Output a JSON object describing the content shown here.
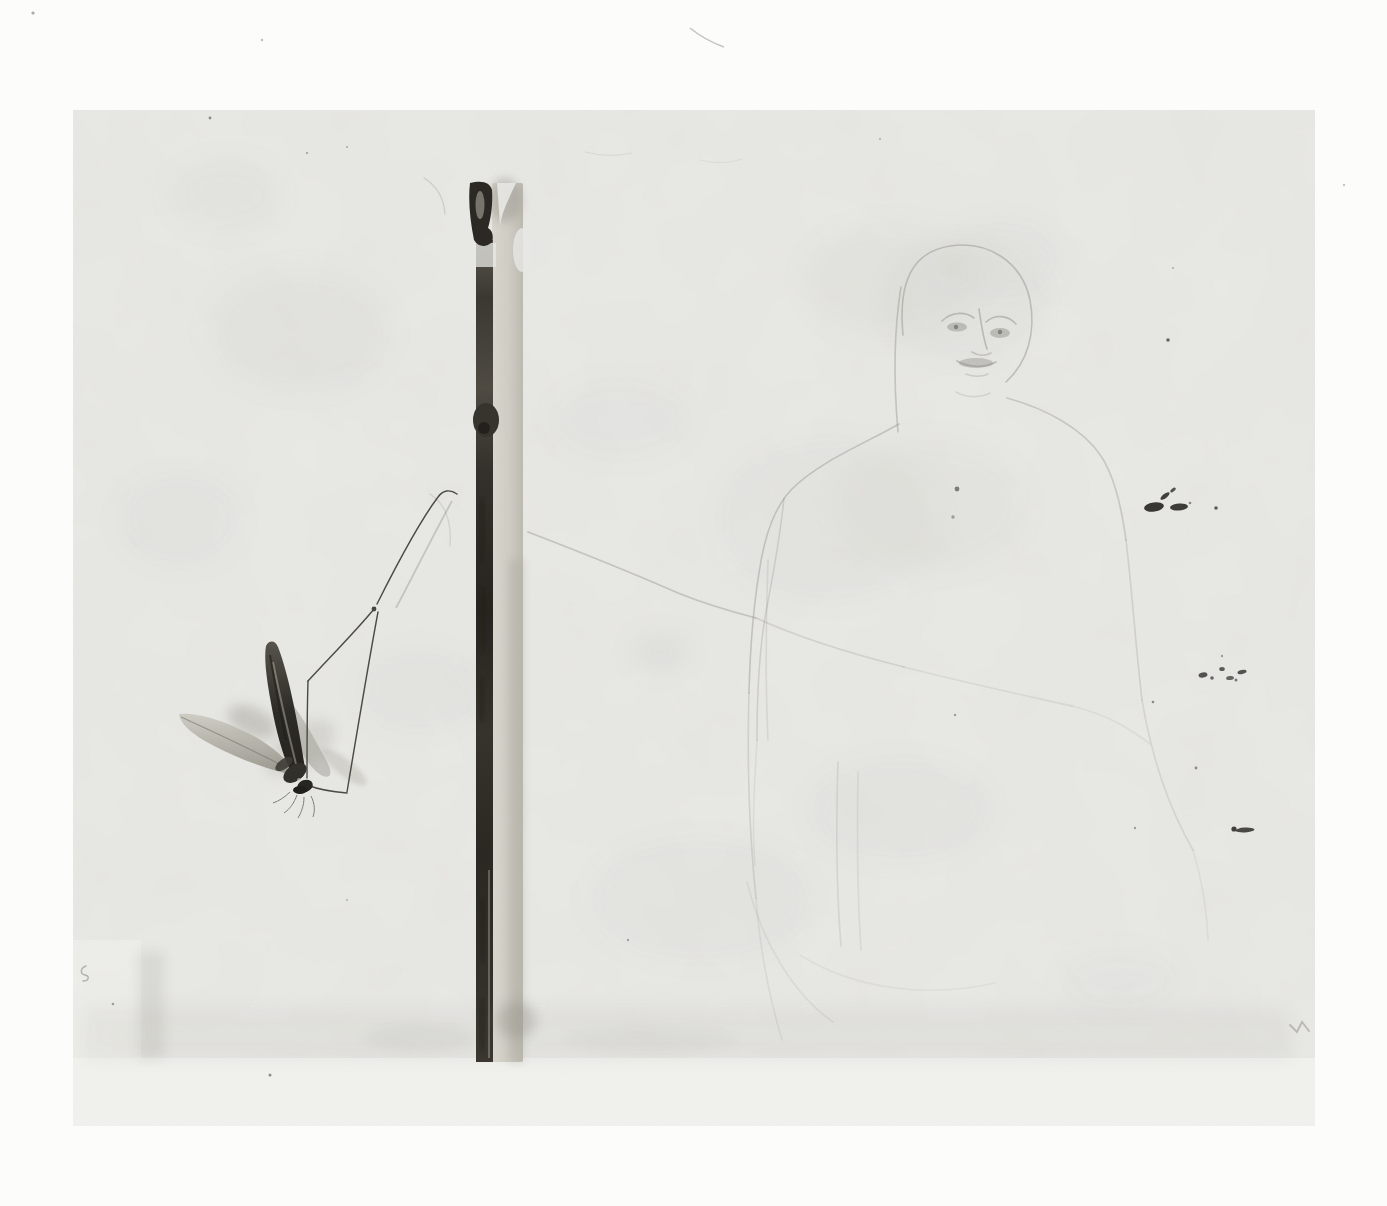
{
  "artwork": {
    "medium": "black-and-white photograph of a mixed-media drawing",
    "description": "A pale gray sheet bears a faint graphite sketch of a bald figure's head and torso on the right, a vertical dried plant stem with a dark fibrous edge left of center, and a pressed crane-fly-like insect with dark folded wings and long angular jointed legs on the lower left. Clusters of small dark ink specks, a short dash, an S-shaped squiggle and soft creases mark the paper.",
    "elements": {
      "insect": "pressed crane fly: one dark upright wing, one pale horizontal wing, translucent wing shadow, dark body with antennae hairs, long jointed legs forming an angular loop",
      "stem": "vertical plant stem: dark cap with loop at top, pinch below, dark left stripe with knot, pale tan column on right, ending at the sheet's lower margin",
      "figure": "faint pencil sketch: bald head outline, two shaded eyes with brows, nose line, dark small mouth, sloping left and right shoulder contours fading down the torso, two faint vertical torso lines, small chest dot",
      "marks": "upper-right ink speck cluster, mid-right speck scatter, short horizontal dash, light V-shaped mark near right edge, small S squiggle at left edge, diagonal and vertical creases mid-sheet, stray hair above the sheet"
    }
  },
  "palette": {
    "page_bg": "#fcfcfb",
    "sheet": "#e9e9e6",
    "sheet_margin": "#f1f1ee",
    "sketch_line": "#8f8d86",
    "crease_line": "#a39f96",
    "insect_leg": "#4b4943",
    "insect_dark": "#2b2925",
    "stem_dark": "#2e2b26",
    "stem_light": "#cfcdc4",
    "speck": "#2e2c29",
    "faint_mark": "#8d8b82"
  }
}
